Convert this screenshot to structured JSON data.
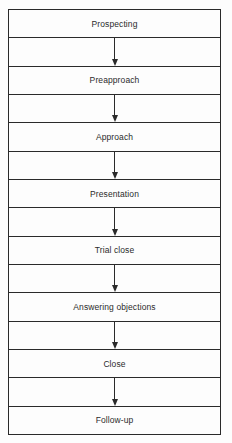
{
  "diagram": {
    "type": "vertical-flowchart",
    "steps": [
      {
        "label": "Prospecting"
      },
      {
        "label": "Preapproach"
      },
      {
        "label": "Approach"
      },
      {
        "label": "Presentation"
      },
      {
        "label": "Trial close"
      },
      {
        "label": "Answering objections"
      },
      {
        "label": "Close"
      },
      {
        "label": "Follow-up"
      }
    ],
    "connectors": [
      {
        "from": "Prospecting",
        "to": "Preapproach"
      },
      {
        "from": "Preapproach",
        "to": "Approach"
      },
      {
        "from": "Approach",
        "to": "Presentation"
      },
      {
        "from": "Presentation",
        "to": "Trial close"
      },
      {
        "from": "Trial close",
        "to": "Answering objections"
      },
      {
        "from": "Answering objections",
        "to": "Close"
      },
      {
        "from": "Close",
        "to": "Follow-up"
      }
    ],
    "colors": {
      "line": "#2a2a2a",
      "text": "#2b2b2b",
      "background": "#fdfdfd"
    }
  }
}
